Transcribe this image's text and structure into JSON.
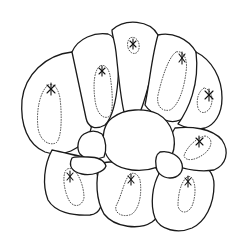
{
  "figure": {
    "type": "line-drawing",
    "background": "#ffffff",
    "stroke_color": "#1a1a1a"
  },
  "cells": {
    "outer_count": 8,
    "central_count": 1,
    "small_count": 3,
    "markers": "star (asterisk) inside dotted region in each outer cell"
  }
}
